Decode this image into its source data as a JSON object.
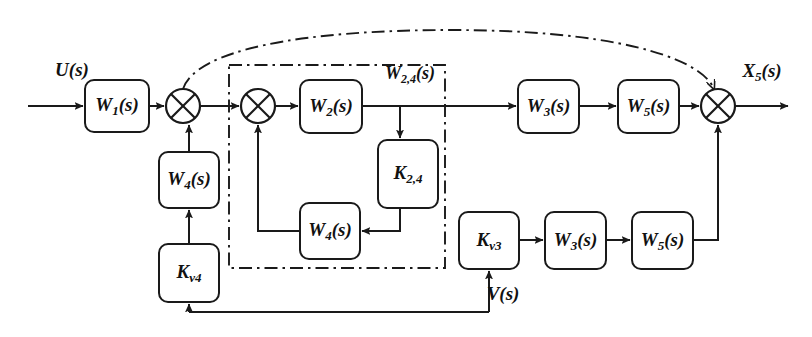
{
  "diagram": {
    "type": "control-system-block-diagram",
    "title": "",
    "canvas": {
      "width": 812,
      "height": 337
    },
    "colors": {
      "line": "#1a1a1a",
      "background": "#ffffff",
      "block_fill": "#ffffff"
    }
  },
  "blocks": [
    {
      "id": "w1",
      "base": "W",
      "sub": "1",
      "arg": "(s)",
      "x": 85,
      "y": 80,
      "w": 64,
      "h": 52
    },
    {
      "id": "w4_outer",
      "base": "W",
      "sub": "4",
      "arg": "(s)",
      "x": 159,
      "y": 152,
      "w": 60,
      "h": 56
    },
    {
      "id": "kv4",
      "base": "K",
      "sub": "v4",
      "arg": "",
      "x": 159,
      "y": 244,
      "w": 60,
      "h": 58
    },
    {
      "id": "w2",
      "base": "W",
      "sub": "2",
      "arg": "(s)",
      "x": 300,
      "y": 80,
      "w": 62,
      "h": 53
    },
    {
      "id": "k24",
      "base": "K",
      "sub": "2,4",
      "arg": "",
      "x": 378,
      "y": 140,
      "w": 60,
      "h": 68
    },
    {
      "id": "w4_inner",
      "base": "W",
      "sub": "4",
      "arg": "(s)",
      "x": 300,
      "y": 203,
      "w": 60,
      "h": 56
    },
    {
      "id": "w3_top",
      "base": "W",
      "sub": "3",
      "arg": "(s)",
      "x": 518,
      "y": 80,
      "w": 61,
      "h": 53
    },
    {
      "id": "w5_top",
      "base": "W",
      "sub": "5",
      "arg": "(s)",
      "x": 618,
      "y": 80,
      "w": 61,
      "h": 53
    },
    {
      "id": "kv3",
      "base": "K",
      "sub": "v3",
      "arg": "",
      "x": 459,
      "y": 212,
      "w": 60,
      "h": 57
    },
    {
      "id": "w3_bot",
      "base": "W",
      "sub": "3",
      "arg": "(s)",
      "x": 545,
      "y": 212,
      "w": 61,
      "h": 57
    },
    {
      "id": "w5_bot",
      "base": "W",
      "sub": "5",
      "arg": "(s)",
      "x": 632,
      "y": 212,
      "w": 61,
      "h": 57
    }
  ],
  "summing_junctions": [
    {
      "id": "sum1",
      "cx": 183,
      "cy": 106,
      "r": 17
    },
    {
      "id": "sum2",
      "cx": 258,
      "cy": 106,
      "r": 17
    },
    {
      "id": "sum3",
      "cx": 718,
      "cy": 106,
      "r": 17
    }
  ],
  "signals": [
    {
      "id": "u",
      "base": "U",
      "sub": "",
      "arg": "(s)",
      "x": 72,
      "y": 72
    },
    {
      "id": "x5",
      "base": "X",
      "sub": "5",
      "arg": "(s)",
      "x": 762,
      "y": 73
    },
    {
      "id": "v",
      "base": "V",
      "sub": "",
      "arg": "(s)",
      "x": 503,
      "y": 296
    }
  ],
  "group_box": {
    "id": "w24_group",
    "base": "W",
    "sub": "2,4",
    "arg": "(s)",
    "label_x": 410,
    "label_y": 75,
    "x": 229,
    "y": 65,
    "w": 216,
    "h": 203
  },
  "outer_feedback": {
    "id": "w24_outer_arc",
    "path": "M 183 89 C 196 50, 300 30, 452 30 C 604 30, 700 55, 714 89"
  },
  "wire_paths": [
    {
      "id": "u-to-w1",
      "d": "M 28 106 L 83 106",
      "arrow": "end"
    },
    {
      "id": "w1-to-sum1",
      "d": "M 149 106 L 164 106",
      "arrow": "end"
    },
    {
      "id": "sum1-to-sum2",
      "d": "M 200 106 L 239 106",
      "arrow": "end"
    },
    {
      "id": "sum2-to-w2",
      "d": "M 275 106 L 298 106",
      "arrow": "end"
    },
    {
      "id": "w2-to-w3top",
      "d": "M 362 106 L 516 106",
      "arrow": "end"
    },
    {
      "id": "w3top-to-w5top",
      "d": "M 579 106 L 616 106",
      "arrow": "end"
    },
    {
      "id": "w5top-to-sum3",
      "d": "M 679 106 L 699 106",
      "arrow": "end"
    },
    {
      "id": "sum3-to-x5out",
      "d": "M 735 106 L 788 106",
      "arrow": "end"
    },
    {
      "id": "w2tap-to-k24",
      "d": "M 400 106 L 400 138",
      "arrow": "end"
    },
    {
      "id": "k24-to-w4inner",
      "d": "M 400 208 L 400 231 L 362 231",
      "arrow": "end"
    },
    {
      "id": "w4inner-to-sum2",
      "d": "M 300 231 L 258 231 L 258 125",
      "arrow": "end"
    },
    {
      "id": "kv4-to-w4outer",
      "d": "M 189 244 L 189 210",
      "arrow": "end"
    },
    {
      "id": "w4outer-to-sum1",
      "d": "M 189 152 L 189 125",
      "arrow": "end"
    },
    {
      "id": "vbus-to-kv4",
      "d": "M 189 312 L 189 304",
      "arrow": "end"
    },
    {
      "id": "vbus-line",
      "d": "M 189 312 L 489 312",
      "arrow": "none"
    },
    {
      "id": "vbus-to-kv3",
      "d": "M 489 312 L 489 271",
      "arrow": "end"
    },
    {
      "id": "kv3-to-w3bot",
      "d": "M 519 240 L 543 240",
      "arrow": "end"
    },
    {
      "id": "w3bot-to-w5bot",
      "d": "M 606 240 L 630 240",
      "arrow": "end"
    },
    {
      "id": "w5bot-to-sum3",
      "d": "M 693 240 L 718 240 L 718 125",
      "arrow": "end"
    }
  ]
}
